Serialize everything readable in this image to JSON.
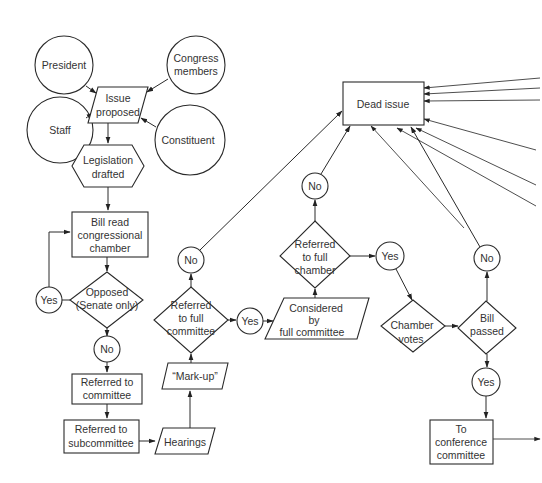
{
  "diagram": {
    "nodes": {
      "president": {
        "label": "President"
      },
      "congress_members": {
        "line1": "Congress",
        "line2": "members"
      },
      "staff": {
        "label": "Staff"
      },
      "constituent": {
        "label": "Constituent"
      },
      "issue_proposed": {
        "line1": "Issue",
        "line2": "proposed"
      },
      "legislation_drafted": {
        "line1": "Legislation",
        "line2": "drafted"
      },
      "bill_read": {
        "line1": "Bill read",
        "line2": "congressional",
        "line3": "chamber"
      },
      "opposed": {
        "line1": "Opposed",
        "line2": "(Senate only)"
      },
      "opposed_yes": {
        "label": "Yes"
      },
      "opposed_no": {
        "label": "No"
      },
      "referred_committee": {
        "line1": "Referred to",
        "line2": "committee"
      },
      "referred_subcommittee": {
        "line1": "Referred to",
        "line2": "subcommittee"
      },
      "hearings": {
        "label": "Hearings"
      },
      "markup": {
        "label": "“Mark-up”"
      },
      "referred_full_committee": {
        "line1": "Referred",
        "line2": "to  full",
        "line3": "committee"
      },
      "rfc_no": {
        "label": "No"
      },
      "rfc_yes": {
        "label": "Yes"
      },
      "considered_full_committee": {
        "line1": "Considered",
        "line2": "by",
        "line3": "full committee"
      },
      "referred_full_chamber": {
        "line1": "Referred",
        "line2": "to full",
        "line3": "chamber"
      },
      "rfch_no": {
        "label": "No"
      },
      "rfch_yes": {
        "label": "Yes"
      },
      "chamber_votes": {
        "line1": "Chamber",
        "line2": "votes"
      },
      "bill_passed": {
        "line1": "Bill",
        "line2": "passed"
      },
      "bp_no": {
        "label": "No"
      },
      "bp_yes": {
        "label": "Yes"
      },
      "conference_committee": {
        "line1": "To",
        "line2": "conference",
        "line3": "committee"
      },
      "dead_issue": {
        "label": "Dead issue"
      }
    }
  }
}
